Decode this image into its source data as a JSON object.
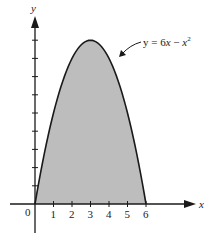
{
  "chart_data": {
    "type": "area",
    "title": "",
    "function_label": "y = 6x − x²",
    "label_parts": {
      "lhs": "y = 6",
      "var1": "x",
      "minus": " − ",
      "var2": "x",
      "exp": "2"
    },
    "xlabel": "x",
    "ylabel": "y",
    "origin_label": "0",
    "x_ticks": [
      1,
      2,
      3,
      4,
      5,
      6
    ],
    "x_tick_labels": [
      "1",
      "2",
      "3",
      "4",
      "5",
      "6"
    ],
    "y_ticks": [
      1,
      2,
      3,
      4,
      5,
      6,
      7,
      8,
      9
    ],
    "y_tick_labels": [],
    "xlim": [
      -0.3,
      9
    ],
    "ylim": [
      -1.6,
      10.8
    ],
    "grid": false,
    "shaded_region": {
      "from_x": 0,
      "to_x": 6,
      "description": "area under curve between curve and x-axis"
    },
    "x": [
      0,
      0.5,
      1,
      1.5,
      2,
      2.5,
      3,
      3.5,
      4,
      4.5,
      5,
      5.5,
      6
    ],
    "values": [
      0,
      2.75,
      5,
      6.75,
      8,
      8.75,
      9,
      8.75,
      8,
      6.75,
      5,
      2.75,
      0
    ],
    "colors": {
      "fill": "#bdbdbd",
      "stroke": "#1a1a1a",
      "axis": "#1a1a1a"
    }
  }
}
